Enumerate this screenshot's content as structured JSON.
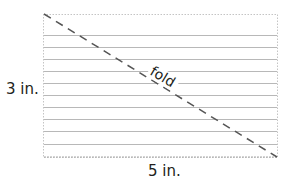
{
  "diagram": {
    "height_label": "3 in.",
    "width_label": "5 in.",
    "fold_label": "fold",
    "ruled_lines": 10,
    "colors": {
      "line": "#b8b8b8",
      "fold": "#555555",
      "text": "#231f20"
    }
  }
}
